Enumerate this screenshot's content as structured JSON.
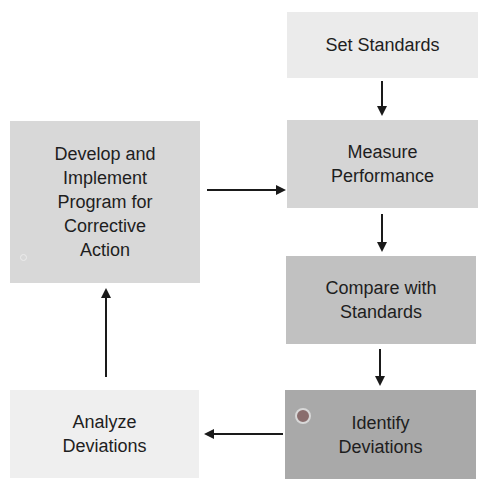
{
  "diagram": {
    "type": "flowchart",
    "title": "",
    "nodes": [
      {
        "id": "set",
        "label": "Set Standards",
        "color": "#ebebeb"
      },
      {
        "id": "measure",
        "label": "Measure\nPerformance",
        "color": "#d5d5d5"
      },
      {
        "id": "compare",
        "label": "Compare with\nStandards",
        "color": "#c1c1c1"
      },
      {
        "id": "identify",
        "label": "Identify\nDeviations",
        "color": "#a9a9a9"
      },
      {
        "id": "analyze",
        "label": "Analyze\nDeviations",
        "color": "#efefef"
      },
      {
        "id": "develop",
        "label": "Develop and\nImplement\nProgram for\nCorrective\nAction",
        "color": "#d8d8d8"
      }
    ],
    "edges": [
      {
        "from": "set",
        "to": "measure"
      },
      {
        "from": "measure",
        "to": "compare"
      },
      {
        "from": "compare",
        "to": "identify"
      },
      {
        "from": "identify",
        "to": "analyze"
      },
      {
        "from": "analyze",
        "to": "develop"
      },
      {
        "from": "develop",
        "to": "measure"
      }
    ],
    "colors": {
      "arrow": "#1a1a1a",
      "text": "#1e1e1e",
      "marker_dot": "#8a6a6a"
    }
  }
}
